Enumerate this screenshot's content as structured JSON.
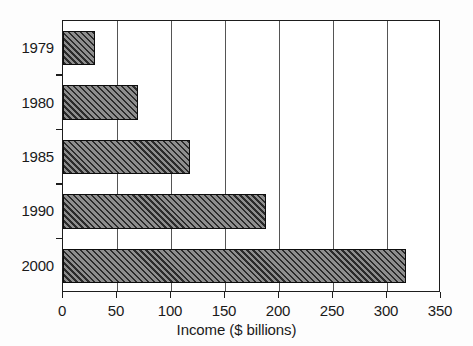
{
  "chart_data": {
    "type": "bar",
    "orientation": "horizontal",
    "title": "",
    "xlabel": "Income ($ billions)",
    "ylabel": "",
    "categories": [
      "1979",
      "1980",
      "1985",
      "1990",
      "2000"
    ],
    "values": [
      30,
      69,
      118,
      188,
      318
    ],
    "xlim": [
      0,
      350
    ],
    "xticks": [
      "0",
      "50",
      "100",
      "150",
      "200",
      "250",
      "300",
      "350"
    ],
    "xtick_values": [
      0,
      50,
      100,
      150,
      200,
      250,
      300,
      350
    ],
    "grid": "vertical gridlines at each x tick",
    "legend": "none",
    "series": [
      {
        "name": "Income",
        "values": [
          30,
          69,
          118,
          188,
          318
        ]
      }
    ],
    "bar_style": {
      "fill": "#8e8e8e",
      "hatch": "diagonal forward-slash lines",
      "hatch_color": "#2b2b2b",
      "edge": "#0d0d0d"
    },
    "background": "#ffffff"
  }
}
